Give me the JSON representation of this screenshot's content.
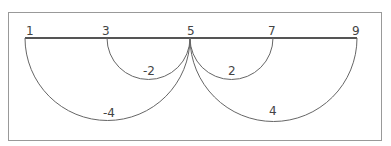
{
  "diagram": {
    "points": [
      {
        "label": "1",
        "x": 25
      },
      {
        "label": "3",
        "x": 107
      },
      {
        "label": "5",
        "x": 190
      },
      {
        "label": "7",
        "x": 273
      },
      {
        "label": "9",
        "x": 357
      }
    ],
    "arcs": [
      {
        "from": "1",
        "to": "5",
        "label": "-4"
      },
      {
        "from": "3",
        "to": "5",
        "label": "-2"
      },
      {
        "from": "5",
        "to": "7",
        "label": "2"
      },
      {
        "from": "5",
        "to": "9",
        "label": "4"
      }
    ],
    "colors": {
      "line": "#555555",
      "border": "#999999",
      "text": "#444444"
    }
  }
}
